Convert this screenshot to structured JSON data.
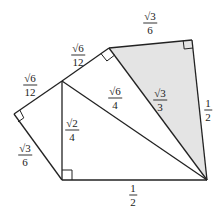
{
  "diagram": {
    "type": "geometry",
    "colors": {
      "stroke": "#222222",
      "shade": "#e4e4e4",
      "background": "#ffffff"
    },
    "points": {
      "A": [
        62,
        180
      ],
      "O": [
        207,
        180
      ],
      "B": [
        62,
        81
      ],
      "C": [
        14,
        114
      ],
      "D": [
        109,
        48
      ],
      "E": [
        192,
        40
      ]
    },
    "labels": [
      {
        "id": "AO",
        "num": "1",
        "den": "2",
        "x": 133,
        "y": 195
      },
      {
        "id": "AB",
        "num": "√2",
        "den": "4",
        "x": 72,
        "y": 130
      },
      {
        "id": "AC",
        "num": "√3",
        "den": "6",
        "x": 25,
        "y": 155
      },
      {
        "id": "CB",
        "num": "√6",
        "den": "12",
        "x": 30,
        "y": 85
      },
      {
        "id": "BD",
        "num": "√6",
        "den": "12",
        "x": 78,
        "y": 55
      },
      {
        "id": "BO",
        "num": "√6",
        "den": "4",
        "x": 115,
        "y": 98
      },
      {
        "id": "DE",
        "num": "√3",
        "den": "6",
        "x": 150,
        "y": 23
      },
      {
        "id": "DO",
        "num": "√3",
        "den": "3",
        "x": 160,
        "y": 100
      },
      {
        "id": "EO",
        "num": "1",
        "den": "2",
        "x": 208,
        "y": 110
      }
    ]
  }
}
